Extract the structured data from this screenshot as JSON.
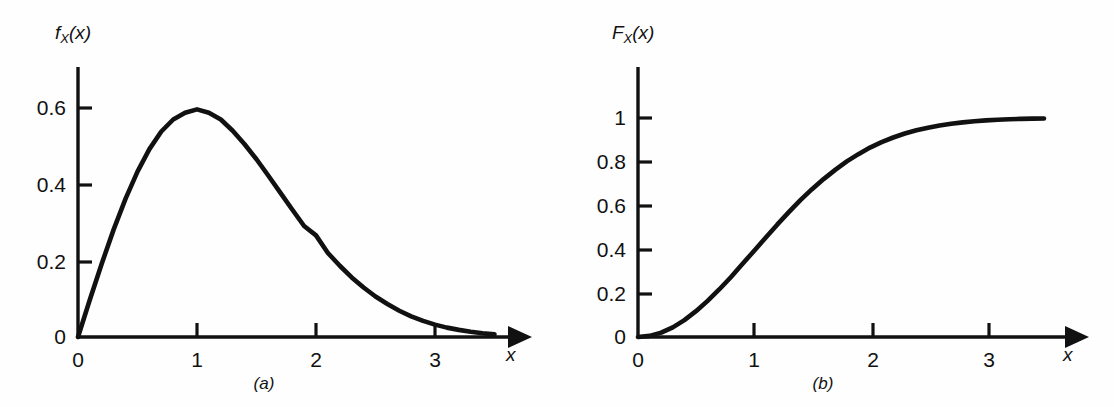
{
  "figure": {
    "background_color": "#fefefe",
    "ink_color": "#111111",
    "panel_count": 2
  },
  "panels": [
    {
      "id": "a",
      "sub_caption": "(a)",
      "y_axis_label": "f",
      "y_axis_label_sub": "X",
      "y_axis_label_arg": "(x)",
      "x_axis_label": "x",
      "y_ticks": [
        "0",
        "0.2",
        "0.4",
        "0.6"
      ],
      "x_ticks": [
        "0",
        "1",
        "2",
        "3"
      ]
    },
    {
      "id": "b",
      "sub_caption": "(b)",
      "y_axis_label": "F",
      "y_axis_label_sub": "X",
      "y_axis_label_arg": "(x)",
      "x_axis_label": "x",
      "y_ticks": [
        "0",
        "0.2",
        "0.4",
        "0.6",
        "0.8",
        "1"
      ],
      "x_ticks": [
        "0",
        "1",
        "2",
        "3"
      ]
    }
  ],
  "chart_data": [
    {
      "type": "line",
      "title": "",
      "subtitle": "(a)",
      "xlabel": "x",
      "ylabel": "f_X(x)",
      "xlim": [
        0,
        3.75
      ],
      "ylim": [
        0,
        0.72
      ],
      "grid": false,
      "legend": "none",
      "xticks": [
        0,
        1,
        2,
        3
      ],
      "xticklabels": [
        "0",
        "1",
        "2",
        "3"
      ],
      "yticks": [
        0,
        0.2,
        0.4,
        0.6
      ],
      "yticklabels": [
        "0",
        "0.2",
        "0.4",
        "0.6"
      ],
      "series": [
        {
          "name": "f_X(x)",
          "description": "Rayleigh probability density function, sigma = 1: f(x) = x*exp(-x^2/2)",
          "color": "#111111",
          "linewidth": 4,
          "x": [
            0,
            0.1,
            0.2,
            0.3,
            0.4,
            0.5,
            0.6,
            0.7,
            0.8,
            0.9,
            1.0,
            1.1,
            1.2,
            1.3,
            1.4,
            1.5,
            1.6,
            1.7,
            1.8,
            1.9,
            2.0,
            2.1,
            2.2,
            2.3,
            2.4,
            2.5,
            2.6,
            2.7,
            2.8,
            2.9,
            3.0,
            3.1,
            3.2,
            3.3,
            3.4,
            3.5
          ],
          "y": [
            0.0,
            0.1,
            0.196,
            0.287,
            0.369,
            0.441,
            0.501,
            0.548,
            0.58,
            0.598,
            0.607,
            0.598,
            0.58,
            0.55,
            0.514,
            0.474,
            0.43,
            0.385,
            0.34,
            0.296,
            0.271,
            0.224,
            0.19,
            0.159,
            0.132,
            0.108,
            0.088,
            0.07,
            0.055,
            0.043,
            0.033,
            0.025,
            0.019,
            0.014,
            0.01,
            0.007
          ]
        }
      ]
    },
    {
      "type": "line",
      "title": "",
      "subtitle": "(b)",
      "xlabel": "x",
      "ylabel": "F_X(x)",
      "xlim": [
        0,
        3.75
      ],
      "ylim": [
        0,
        1.2
      ],
      "grid": false,
      "legend": "none",
      "xticks": [
        0,
        1,
        2,
        3
      ],
      "xticklabels": [
        "0",
        "1",
        "2",
        "3"
      ],
      "yticks": [
        0,
        0.2,
        0.4,
        0.6,
        0.8,
        1.0
      ],
      "yticklabels": [
        "0",
        "0.2",
        "0.4",
        "0.6",
        "0.8",
        "1"
      ],
      "series": [
        {
          "name": "F_X(x)",
          "description": "Rayleigh cumulative distribution function, sigma = 1: F(x) = 1 - exp(-x^2/2)",
          "color": "#111111",
          "linewidth": 4,
          "x": [
            0,
            0.1,
            0.2,
            0.3,
            0.4,
            0.5,
            0.6,
            0.7,
            0.8,
            0.9,
            1.0,
            1.1,
            1.2,
            1.3,
            1.4,
            1.5,
            1.6,
            1.7,
            1.8,
            1.9,
            2.0,
            2.1,
            2.2,
            2.3,
            2.4,
            2.5,
            2.6,
            2.7,
            2.8,
            2.9,
            3.0,
            3.1,
            3.2,
            3.3,
            3.4,
            3.5
          ],
          "y": [
            0.0,
            0.005,
            0.02,
            0.044,
            0.077,
            0.118,
            0.165,
            0.217,
            0.273,
            0.333,
            0.393,
            0.453,
            0.513,
            0.57,
            0.625,
            0.675,
            0.721,
            0.763,
            0.802,
            0.835,
            0.865,
            0.89,
            0.911,
            0.929,
            0.944,
            0.956,
            0.966,
            0.974,
            0.98,
            0.985,
            0.989,
            0.992,
            0.994,
            0.996,
            0.997,
            0.998
          ]
        }
      ]
    }
  ]
}
